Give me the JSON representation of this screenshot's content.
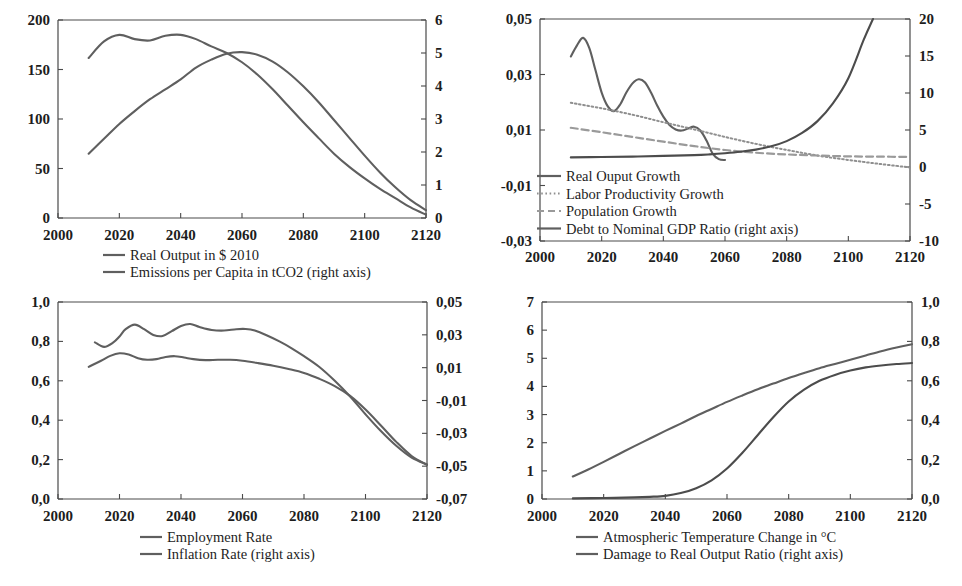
{
  "figure": {
    "panels": [
      "top-left",
      "top-right",
      "bottom-left",
      "bottom-right"
    ],
    "x_tick_labels": [
      "2000",
      "2020",
      "2040",
      "2060",
      "2080",
      "2100",
      "2120"
    ]
  },
  "chart_data": [
    {
      "id": "real-output-emissions",
      "type": "line",
      "title": "",
      "xlabel": "",
      "ylabel": "",
      "xlim": [
        2000,
        2120
      ],
      "xticks": [
        2000,
        2020,
        2040,
        2060,
        2080,
        2100,
        2120
      ],
      "xticklabels": [
        "2000",
        "2020",
        "2040",
        "2060",
        "2080",
        "2100",
        "2120"
      ],
      "ylim": [
        0,
        200
      ],
      "yticks": [
        0,
        50,
        100,
        150,
        200
      ],
      "yticklabels": [
        "0",
        "50",
        "100",
        "150",
        "200"
      ],
      "y2lim": [
        0,
        6
      ],
      "y2ticks": [
        0,
        1,
        2,
        3,
        4,
        5,
        6
      ],
      "y2ticklabels": [
        "0",
        "1",
        "2",
        "3",
        "4",
        "5",
        "6"
      ],
      "grid": false,
      "legend_position": "below",
      "series": [
        {
          "name": "Real Output in $ 2010",
          "axis": "left",
          "style": "solid",
          "color": "#5f5f5f",
          "x": [
            2010,
            2015,
            2020,
            2025,
            2030,
            2035,
            2040,
            2045,
            2050,
            2055,
            2060,
            2065,
            2070,
            2075,
            2080,
            2085,
            2090,
            2095,
            2100,
            2105,
            2110,
            2115,
            2120
          ],
          "y": [
            65,
            80,
            95,
            108,
            120,
            130,
            140,
            152,
            160,
            166,
            167.5,
            165,
            158,
            147,
            133,
            117,
            99,
            81,
            63,
            46,
            31,
            18,
            8
          ]
        },
        {
          "name": "Emissions per Capita in tCO2 (right axis)",
          "axis": "right",
          "style": "solid",
          "color": "#5f5f5f",
          "x": [
            2010,
            2015,
            2020,
            2025,
            2030,
            2035,
            2040,
            2045,
            2050,
            2055,
            2060,
            2065,
            2070,
            2075,
            2080,
            2085,
            2090,
            2095,
            2100,
            2105,
            2110,
            2115,
            2120
          ],
          "y": [
            4.85,
            5.35,
            5.55,
            5.42,
            5.38,
            5.52,
            5.55,
            5.42,
            5.2,
            5.0,
            4.72,
            4.35,
            3.9,
            3.4,
            2.9,
            2.42,
            1.95,
            1.55,
            1.2,
            0.88,
            0.6,
            0.32,
            0.1
          ]
        }
      ]
    },
    {
      "id": "growth-and-debt",
      "type": "line",
      "title": "",
      "xlabel": "",
      "ylabel": "",
      "xlim": [
        2000,
        2120
      ],
      "xticks": [
        2000,
        2020,
        2040,
        2060,
        2080,
        2100,
        2120
      ],
      "xticklabels": [
        "2000",
        "2020",
        "2040",
        "2060",
        "2080",
        "2100",
        "2120"
      ],
      "ylim": [
        -0.03,
        0.05
      ],
      "yticks": [
        -0.03,
        -0.01,
        0.01,
        0.03,
        0.05
      ],
      "yticklabels": [
        "-0,03",
        "-0,01",
        "0,01",
        "0,03",
        "0,05"
      ],
      "y2lim": [
        -10,
        20
      ],
      "y2ticks": [
        -10,
        -5,
        0,
        5,
        10,
        15,
        20
      ],
      "y2ticklabels": [
        "-10",
        "-5",
        "0",
        "5",
        "10",
        "15",
        "20"
      ],
      "grid": false,
      "legend_position": "inside-left",
      "series": [
        {
          "name": "Real Ouput Growth",
          "axis": "left",
          "style": "solid",
          "color": "#5f5f5f",
          "x": [
            2010,
            2012,
            2014,
            2016,
            2018,
            2020,
            2022,
            2024,
            2026,
            2028,
            2030,
            2032,
            2034,
            2036,
            2038,
            2040,
            2042,
            2044,
            2046,
            2048,
            2050,
            2052,
            2054,
            2056,
            2058,
            2060
          ],
          "y": [
            0.0365,
            0.0405,
            0.0432,
            0.0395,
            0.0315,
            0.0235,
            0.0185,
            0.0168,
            0.0192,
            0.0235,
            0.0268,
            0.0283,
            0.0272,
            0.0235,
            0.0188,
            0.0148,
            0.0118,
            0.0102,
            0.0098,
            0.0105,
            0.0112,
            0.0098,
            0.0062,
            0.0015,
            -0.0005,
            -0.0008
          ]
        },
        {
          "name": "Labor Productivity Growth",
          "axis": "left",
          "style": "dotted",
          "color": "#8f8f8f",
          "x": [
            2010,
            2020,
            2030,
            2040,
            2050,
            2060,
            2070,
            2080,
            2090,
            2100,
            2110,
            2120
          ],
          "y": [
            0.0198,
            0.0178,
            0.0155,
            0.0128,
            0.0102,
            0.0075,
            0.005,
            0.0028,
            0.0008,
            -0.0008,
            -0.0022,
            -0.0035
          ]
        },
        {
          "name": "Population Growth",
          "axis": "left",
          "style": "dashed",
          "color": "#9a9a9a",
          "x": [
            2010,
            2020,
            2030,
            2040,
            2050,
            2060,
            2070,
            2080,
            2090,
            2100,
            2110,
            2120
          ],
          "y": [
            0.0108,
            0.0092,
            0.0075,
            0.0058,
            0.0042,
            0.0028,
            0.0018,
            0.0012,
            0.0008,
            0.0005,
            0.0004,
            0.0003
          ]
        },
        {
          "name": "Debt to Nominal GDP Ratio (right axis)",
          "axis": "right",
          "style": "solid",
          "color": "#4c4c4c",
          "x": [
            2010,
            2020,
            2030,
            2040,
            2050,
            2055,
            2060,
            2065,
            2070,
            2075,
            2080,
            2085,
            2090,
            2095,
            2100,
            2105,
            2108
          ],
          "y": [
            1.3,
            1.35,
            1.4,
            1.5,
            1.6,
            1.7,
            1.85,
            2.05,
            2.35,
            2.8,
            3.5,
            4.6,
            6.2,
            8.6,
            12.0,
            17.2,
            20.0
          ]
        }
      ]
    },
    {
      "id": "employment-inflation",
      "type": "line",
      "title": "",
      "xlabel": "",
      "ylabel": "",
      "xlim": [
        2000,
        2120
      ],
      "xticks": [
        2000,
        2020,
        2040,
        2060,
        2080,
        2100,
        2120
      ],
      "xticklabels": [
        "2000",
        "2020",
        "2040",
        "2060",
        "2080",
        "2100",
        "2120"
      ],
      "ylim": [
        0.0,
        1.0
      ],
      "yticks": [
        0.0,
        0.2,
        0.4,
        0.6,
        0.8,
        1.0
      ],
      "yticklabels": [
        "0,0",
        "0,2",
        "0,4",
        "0,6",
        "0,8",
        "1,0"
      ],
      "y2lim": [
        -0.07,
        0.05
      ],
      "y2ticks": [
        -0.07,
        -0.05,
        -0.03,
        -0.01,
        0.01,
        0.03,
        0.05
      ],
      "y2ticklabels": [
        "-0,07",
        "-0,05",
        "-0,03",
        "-0,01",
        "0,01",
        "0,03",
        "0,05"
      ],
      "grid": false,
      "legend_position": "below",
      "series": [
        {
          "name": "Employment Rate",
          "axis": "left",
          "style": "solid",
          "color": "#5f5f5f",
          "x": [
            2012,
            2015,
            2018,
            2020,
            2022,
            2025,
            2028,
            2031,
            2034,
            2037,
            2040,
            2043,
            2046,
            2050,
            2054,
            2058,
            2061,
            2064,
            2068,
            2072,
            2076,
            2080,
            2085,
            2090,
            2095,
            2100,
            2105,
            2110,
            2115,
            2120
          ],
          "y": [
            0.795,
            0.772,
            0.795,
            0.825,
            0.862,
            0.885,
            0.862,
            0.833,
            0.827,
            0.852,
            0.878,
            0.888,
            0.873,
            0.858,
            0.855,
            0.862,
            0.863,
            0.855,
            0.83,
            0.8,
            0.765,
            0.725,
            0.67,
            0.6,
            0.52,
            0.43,
            0.345,
            0.27,
            0.21,
            0.175
          ]
        },
        {
          "name": "Inflation Rate (right axis)",
          "axis": "right",
          "style": "solid",
          "color": "#5f5f5f",
          "x": [
            2010,
            2014,
            2017,
            2020,
            2023,
            2026,
            2029,
            2032,
            2035,
            2038,
            2041,
            2044,
            2048,
            2052,
            2056,
            2060,
            2065,
            2070,
            2075,
            2080,
            2085,
            2090,
            2095,
            2100,
            2105,
            2110,
            2115,
            2120
          ],
          "y": [
            0.0105,
            0.0142,
            0.0172,
            0.0188,
            0.018,
            0.0158,
            0.0148,
            0.0152,
            0.0165,
            0.017,
            0.0162,
            0.0152,
            0.0146,
            0.0148,
            0.0148,
            0.0142,
            0.0128,
            0.0112,
            0.0092,
            0.0068,
            0.0032,
            -0.0012,
            -0.0072,
            -0.0155,
            -0.0252,
            -0.0352,
            -0.0438,
            -0.0492
          ]
        }
      ]
    },
    {
      "id": "temperature-damage",
      "type": "line",
      "title": "",
      "xlabel": "",
      "ylabel": "",
      "xlim": [
        2000,
        2120
      ],
      "xticks": [
        2000,
        2020,
        2040,
        2060,
        2080,
        2100,
        2120
      ],
      "xticklabels": [
        "2000",
        "2020",
        "2040",
        "2060",
        "2080",
        "2100",
        "2120"
      ],
      "ylim": [
        0,
        7
      ],
      "yticks": [
        0,
        1,
        2,
        3,
        4,
        5,
        6,
        7
      ],
      "yticklabels": [
        "0",
        "1",
        "2",
        "3",
        "4",
        "5",
        "6",
        "7"
      ],
      "y2lim": [
        0.0,
        1.0
      ],
      "y2ticks": [
        0.0,
        0.2,
        0.4,
        0.6,
        0.8,
        1.0
      ],
      "y2ticklabels": [
        "0,0",
        "0,2",
        "0,4",
        "0,6",
        "0,8",
        "1,0"
      ],
      "grid": false,
      "legend_position": "below",
      "series": [
        {
          "name": "Atmospheric Temperature Change in °C",
          "axis": "left",
          "style": "solid",
          "color": "#5f5f5f",
          "x": [
            2010,
            2015,
            2020,
            2025,
            2030,
            2035,
            2040,
            2045,
            2050,
            2055,
            2060,
            2065,
            2070,
            2075,
            2080,
            2085,
            2090,
            2095,
            2100,
            2105,
            2110,
            2115,
            2120
          ],
          "y": [
            0.8,
            1.05,
            1.32,
            1.6,
            1.88,
            2.15,
            2.42,
            2.68,
            2.95,
            3.2,
            3.45,
            3.68,
            3.9,
            4.1,
            4.3,
            4.48,
            4.65,
            4.8,
            4.95,
            5.1,
            5.25,
            5.38,
            5.5
          ]
        },
        {
          "name": "Damage to Real Output Ratio  (right axis)",
          "axis": "right",
          "style": "solid",
          "color": "#4c4c4c",
          "x": [
            2010,
            2020,
            2030,
            2035,
            2040,
            2045,
            2050,
            2055,
            2060,
            2065,
            2070,
            2075,
            2080,
            2085,
            2090,
            2095,
            2100,
            2105,
            2110,
            2115,
            2120
          ],
          "y": [
            0.003,
            0.005,
            0.008,
            0.011,
            0.016,
            0.03,
            0.055,
            0.095,
            0.155,
            0.235,
            0.325,
            0.415,
            0.495,
            0.555,
            0.6,
            0.63,
            0.652,
            0.668,
            0.678,
            0.685,
            0.69
          ]
        }
      ]
    }
  ],
  "legends": {
    "panel1": [
      {
        "label": "Real Output in $ 2010",
        "style": "solid"
      },
      {
        "label": "Emissions per Capita in tCO2 (right axis)",
        "style": "solid"
      }
    ],
    "panel2": [
      {
        "label": "Real Ouput Growth",
        "style": "solid"
      },
      {
        "label": "Labor Productivity Growth",
        "style": "dotted"
      },
      {
        "label": "Population Growth",
        "style": "dashed"
      },
      {
        "label": "Debt to Nominal GDP Ratio (right axis)",
        "style": "solid"
      }
    ],
    "panel3": [
      {
        "label": "Employment Rate",
        "style": "solid"
      },
      {
        "label": "Inflation Rate (right axis)",
        "style": "solid"
      }
    ],
    "panel4": [
      {
        "label": "Atmospheric Temperature Change in °C",
        "style": "solid"
      },
      {
        "label": "Damage to Real Output Ratio  (right axis)",
        "style": "solid"
      }
    ]
  },
  "colors": {
    "line_light": "#5f5f5f",
    "line_dark": "#4c4c4c",
    "dotted": "#8f8f8f",
    "dashed": "#9a9a9a",
    "axis": "#4a4a4a",
    "text": "#1d1d1d",
    "background": "#ffffff"
  }
}
